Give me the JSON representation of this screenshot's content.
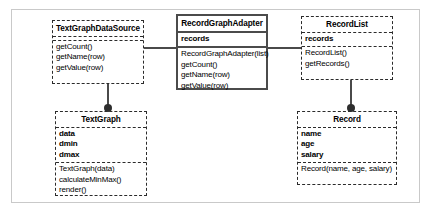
{
  "diagram": {
    "type": "uml-class-diagram",
    "classes": [
      {
        "id": "textgraphdatasource",
        "name": "TextGraphDataSource",
        "stereotype": "interface",
        "border": "dashed",
        "attributes": [],
        "methods": [
          "getCount()",
          "getName(row)",
          "getValue(row)"
        ]
      },
      {
        "id": "recordgraphadapter",
        "name": "RecordGraphAdapter",
        "border": "solid",
        "attributes": [
          "records"
        ],
        "methods": [
          "RecordGraphAdapter(list)",
          "getCount()",
          "getName(row)",
          "getValue(row)"
        ]
      },
      {
        "id": "recordlist",
        "name": "RecordList",
        "border": "dashed",
        "attributes": [
          "records"
        ],
        "methods": [
          "RecordList()",
          "getRecords()"
        ]
      },
      {
        "id": "textgraph",
        "name": "TextGraph",
        "border": "dashed",
        "attributes": [
          "data",
          "dmin",
          "dmax"
        ],
        "methods": [
          "TextGraph(data)",
          "calculateMinMax()",
          "render()"
        ]
      },
      {
        "id": "record",
        "name": "Record",
        "border": "dashed",
        "attributes": [
          "name",
          "age",
          "salary"
        ],
        "methods": [
          "Record(name, age, salary)"
        ]
      }
    ],
    "connectors": [
      {
        "id": "adapter-implements-datasource",
        "from": "recordgraphadapter",
        "to": "textgraphdatasource",
        "style": "plain-line",
        "orientation": "horizontal"
      },
      {
        "id": "adapter-uses-recordlist",
        "from": "recordgraphadapter",
        "to": "recordlist",
        "style": "plain-line",
        "orientation": "horizontal"
      },
      {
        "id": "datasource-to-textgraph",
        "from": "textgraphdatasource",
        "to": "textgraph",
        "style": "ball-end",
        "orientation": "vertical"
      },
      {
        "id": "recordlist-to-record",
        "from": "recordlist",
        "to": "record",
        "style": "ball-end",
        "orientation": "vertical"
      }
    ],
    "colors": {
      "frame": "#c9c9c9",
      "box_border_dashed": "#2b2b2b",
      "box_border_solid": "#4b4b4b",
      "connector": "#4a4a4a",
      "ball": "#2e2e2e",
      "text": "#000000",
      "background": "#ffffff"
    }
  }
}
